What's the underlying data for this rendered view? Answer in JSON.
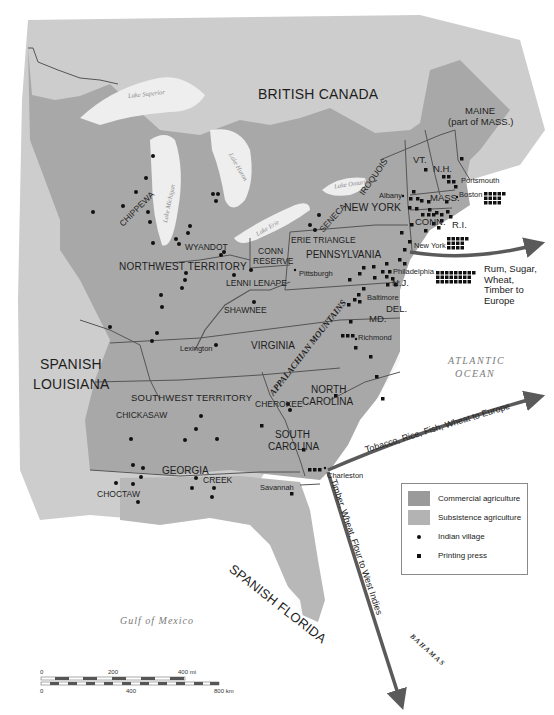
{
  "map": {
    "title": "Eastern North America, c. 1790s: Agriculture, Indian Villages, Printing Presses and Trade",
    "colors": {
      "background": "#ffffff",
      "foreign_land": "#c9c9c9",
      "subsistence_agriculture": "#a9a9a9",
      "commercial_agriculture": "#9a9a9a",
      "water_lakes": "#eeeeee",
      "borders": "#555555",
      "route_arrow": "#5a5a5a",
      "markers": "#111111"
    },
    "regions": {
      "british_canada": "BRITISH CANADA",
      "spanish_louisiana_1": "SPANISH",
      "spanish_louisiana_2": "LOUISIANA",
      "spanish_florida": "SPANISH FLORIDA",
      "northwest_territory": "NORTHWEST TERRITORY",
      "southwest_territory": "SOUTHWEST TERRITORY",
      "conn_reserve_1": "CONN",
      "conn_reserve_2": "RESERVE",
      "erie_triangle": "ERIE TRIANGLE"
    },
    "states": {
      "maine_1": "MAINE",
      "maine_2": "(part of MASS.)",
      "vermont": "VT.",
      "new_hampshire": "N.H.",
      "massachusetts": "MASS.",
      "connecticut": "CONN.",
      "rhode_island": "R.I.",
      "new_york": "NEW YORK",
      "pennsylvania": "PENNSYLVANIA",
      "new_jersey": "N.J.",
      "delaware": "DEL.",
      "maryland": "MD.",
      "virginia": "VIRGINIA",
      "north_carolina_1": "NORTH",
      "north_carolina_2": "CAROLINA",
      "south_carolina_1": "SOUTH",
      "south_carolina_2": "CAROLINA",
      "georgia": "GEORGIA"
    },
    "tribes": {
      "chippewa": "CHIPPEWA",
      "wyandot": "WYANDOT",
      "seneca": "SENECA",
      "iroquois": "IROQUOIS",
      "lenni_lenape": "LENNI LENAPE",
      "shawnee": "SHAWNEE",
      "cherokee": "CHEROKEE",
      "chickasaw": "CHICKASAW",
      "choctaw": "CHOCTAW",
      "creek": "CREEK"
    },
    "cities": {
      "portsmouth": "Portsmouth",
      "boston": "Boston",
      "albany": "Albany",
      "new_york": "New York",
      "philadelphia": "Philadelphia",
      "pittsburgh": "Pittsburgh",
      "baltimore": "Baltimore",
      "richmond": "Richmond",
      "lexington": "Lexington",
      "charleston": "Charleston",
      "savannah": "Savannah"
    },
    "physical": {
      "appalachian": "APPALACHIAN MOUNTAINS",
      "atlantic_1": "ATLANTIC",
      "atlantic_2": "OCEAN",
      "gulf": "Gulf of Mexico",
      "bahamas": "BAHAMAS",
      "lake_superior": "Lake Superior",
      "lake_michigan": "Lake Michigan",
      "lake_huron": "Lake Huron",
      "lake_erie": "Lake Erie",
      "lake_ontario": "Lake Ontario"
    },
    "trade_routes": [
      {
        "id": "north",
        "label_lines": [
          "Rum, Sugar,",
          "Wheat,",
          "Timber to",
          "Europe"
        ]
      },
      {
        "id": "south_europe",
        "label": "Tobacco, Rice, Fish, Wheat to Europe"
      },
      {
        "id": "west_indies",
        "label": "Timber, Wheat, Flour to West Indies"
      }
    ],
    "legend": {
      "items": [
        {
          "label": "Commercial agriculture",
          "type": "swatch",
          "color": "#9a9a9a"
        },
        {
          "label": "Subsistence agriculture",
          "type": "swatch",
          "color": "#b3b3b3"
        },
        {
          "label": "Indian village",
          "type": "dot"
        },
        {
          "label": "Printing press",
          "type": "square"
        }
      ]
    },
    "scale_bar": {
      "mi_ticks": [
        "0",
        "200",
        "400 mi"
      ],
      "km_ticks": [
        "0",
        "400",
        "800 km"
      ]
    }
  }
}
